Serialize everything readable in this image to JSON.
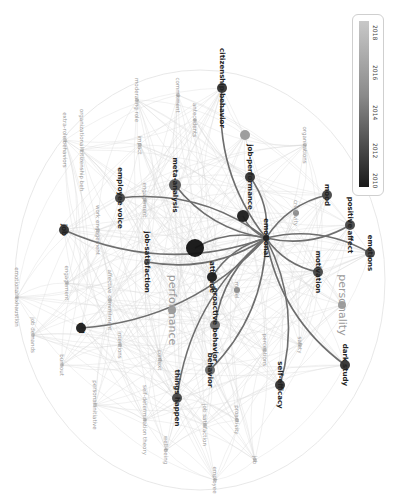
{
  "visualization": {
    "type": "overlay-network",
    "orientation": "rotated 90deg clockwise",
    "legend": {
      "ticks": [
        "2018",
        "2016",
        "2014",
        "2012",
        "2010"
      ],
      "gradient_start": "#c8c8c8",
      "gradient_end": "#1a1a1a"
    },
    "nodes": [
      {
        "id": "citizenship-behavior",
        "label": "citizenship behavior",
        "x": 222,
        "y": 88,
        "r": 5,
        "color": "#333333",
        "bold": true
      },
      {
        "id": "commitment",
        "label": "commitment",
        "x": 178,
        "y": 95,
        "r": 2,
        "color": "#aaaaaa",
        "bold": false
      },
      {
        "id": "moderating-role",
        "label": "moderating role",
        "x": 137,
        "y": 100,
        "r": 2,
        "color": "#aaaaaa",
        "bold": false
      },
      {
        "id": "antecedents",
        "label": "antecedents",
        "x": 195,
        "y": 120,
        "r": 2,
        "color": "#aaaaaa",
        "bold": false
      },
      {
        "id": "extra-role-behaviors",
        "label": "extra-role behaviors",
        "x": 65,
        "y": 140,
        "r": 2,
        "color": "#aaaaaa",
        "bold": false
      },
      {
        "id": "organizational-citizenship-beh",
        "label": "organizational citizenship beh",
        "x": 82,
        "y": 150,
        "r": 2,
        "color": "#aaaaaa",
        "bold": false
      },
      {
        "id": "organizations",
        "label": "organizations",
        "x": 305,
        "y": 145,
        "r": 2,
        "color": "#aaaaaa",
        "bold": false
      },
      {
        "id": "impact",
        "label": "impact",
        "x": 140,
        "y": 145,
        "r": 2,
        "color": "#aaaaaa",
        "bold": false
      },
      {
        "id": "node-grey-top",
        "label": "",
        "x": 245,
        "y": 135,
        "r": 5,
        "color": "#999999",
        "bold": false
      },
      {
        "id": "meta-analysis",
        "label": "meta-analysis",
        "x": 175,
        "y": 185,
        "r": 6,
        "color": "#555555",
        "bold": true
      },
      {
        "id": "job-performance",
        "label": "job-performance",
        "x": 250,
        "y": 177,
        "r": 5,
        "color": "#333333",
        "bold": true
      },
      {
        "id": "employee-voice",
        "label": "employee voice",
        "x": 120,
        "y": 198,
        "r": 5,
        "color": "#444444",
        "bold": true
      },
      {
        "id": "engagement-top",
        "label": "engagement",
        "x": 145,
        "y": 200,
        "r": 2,
        "color": "#aaaaaa",
        "bold": false
      },
      {
        "id": "mood",
        "label": "mood",
        "x": 327,
        "y": 195,
        "r": 5,
        "color": "#444444",
        "bold": true
      },
      {
        "id": "creativity",
        "label": "creativity",
        "x": 296,
        "y": 213,
        "r": 3,
        "color": "#888888",
        "bold": false
      },
      {
        "id": "node-dark-1",
        "label": "",
        "x": 243,
        "y": 216,
        "r": 6,
        "color": "#1a1a1a",
        "bold": false
      },
      {
        "id": "job",
        "label": "job",
        "x": 64,
        "y": 230,
        "r": 5,
        "color": "#333333",
        "bold": true
      },
      {
        "id": "work-engagement",
        "label": "work engagement",
        "x": 98,
        "y": 230,
        "r": 2,
        "color": "#aaaaaa",
        "bold": false
      },
      {
        "id": "positive-affect",
        "label": "positive affect",
        "x": 350,
        "y": 225,
        "r": 5,
        "color": "#444444",
        "bold": true
      },
      {
        "id": "job-satisfaction",
        "label": "job-satisfaction",
        "x": 147,
        "y": 262,
        "r": 3,
        "color": "#666666",
        "bold": true
      },
      {
        "id": "big-dark",
        "label": "",
        "x": 195,
        "y": 248,
        "r": 9,
        "color": "#111111",
        "bold": false
      },
      {
        "id": "center-hub",
        "label": "emotional",
        "x": 266,
        "y": 238,
        "r": 3,
        "color": "#222222",
        "bold": true
      },
      {
        "id": "engagement-left",
        "label": "engagement",
        "x": 67,
        "y": 283,
        "r": 2,
        "color": "#aaaaaa",
        "bold": false
      },
      {
        "id": "emotions",
        "label": "emotions",
        "x": 370,
        "y": 253,
        "r": 5,
        "color": "#444444",
        "bold": true
      },
      {
        "id": "attitude",
        "label": "attitude",
        "x": 212,
        "y": 277,
        "r": 5,
        "color": "#1a1a1a",
        "bold": true
      },
      {
        "id": "motivation",
        "label": "motivation",
        "x": 318,
        "y": 272,
        "r": 5,
        "color": "#444444",
        "bold": true
      },
      {
        "id": "affective-commitment",
        "label": "affective commitment",
        "x": 110,
        "y": 300,
        "r": 2,
        "color": "#aaaaaa",
        "bold": false
      },
      {
        "id": "emotional-exhaustion",
        "label": "emotional exhaustion",
        "x": 17,
        "y": 297,
        "r": 2,
        "color": "#aaaaaa",
        "bold": false
      },
      {
        "id": "model",
        "label": "model",
        "x": 237,
        "y": 290,
        "r": 3,
        "color": "#888888",
        "bold": false
      },
      {
        "id": "performance",
        "label": "performance",
        "x": 172,
        "y": 310,
        "r": 4,
        "color": "#999999",
        "bold": false
      },
      {
        "id": "personality",
        "label": "personality",
        "x": 342,
        "y": 305,
        "r": 4,
        "color": "#999999",
        "bold": false
      },
      {
        "id": "proactive-behavior",
        "label": "proactive behavior",
        "x": 215,
        "y": 325,
        "r": 5,
        "color": "#666666",
        "bold": true
      },
      {
        "id": "job-demands",
        "label": "job demands",
        "x": 33,
        "y": 335,
        "r": 2,
        "color": "#aaaaaa",
        "bold": false
      },
      {
        "id": "ucl",
        "label": "ucl",
        "x": 81,
        "y": 328,
        "r": 5,
        "color": "#1a1a1a",
        "bold": true
      },
      {
        "id": "intentions",
        "label": "intentions",
        "x": 120,
        "y": 345,
        "r": 2,
        "color": "#aaaaaa",
        "bold": false
      },
      {
        "id": "context",
        "label": "context",
        "x": 160,
        "y": 360,
        "r": 2,
        "color": "#aaaaaa",
        "bold": false
      },
      {
        "id": "safety",
        "label": "safety",
        "x": 300,
        "y": 345,
        "r": 2,
        "color": "#aaaaaa",
        "bold": false
      },
      {
        "id": "perceptions",
        "label": "perceptions",
        "x": 265,
        "y": 350,
        "r": 2,
        "color": "#aaaaaa",
        "bold": false
      },
      {
        "id": "dark-study",
        "label": "dark study",
        "x": 345,
        "y": 365,
        "r": 5,
        "color": "#333333",
        "bold": true
      },
      {
        "id": "burnout",
        "label": "burnout",
        "x": 62,
        "y": 365,
        "r": 2,
        "color": "#aaaaaa",
        "bold": false
      },
      {
        "id": "behavior",
        "label": "behavior",
        "x": 210,
        "y": 370,
        "r": 5,
        "color": "#666666",
        "bold": true
      },
      {
        "id": "personal-initiative",
        "label": "personal initiative",
        "x": 95,
        "y": 405,
        "r": 2,
        "color": "#aaaaaa",
        "bold": false
      },
      {
        "id": "self-determination-theory",
        "label": "self-determination theory",
        "x": 145,
        "y": 420,
        "r": 2,
        "color": "#aaaaaa",
        "bold": false
      },
      {
        "id": "things-happen",
        "label": "things happen",
        "x": 177,
        "y": 398,
        "r": 5,
        "color": "#444444",
        "bold": true
      },
      {
        "id": "self-efficacy",
        "label": "self-efficacy",
        "x": 280,
        "y": 385,
        "r": 5,
        "color": "#333333",
        "bold": true
      },
      {
        "id": "proactivity",
        "label": "proactivity",
        "x": 237,
        "y": 420,
        "r": 2,
        "color": "#999999",
        "bold": false
      },
      {
        "id": "job-satisfaction-2",
        "label": "job satisfaction",
        "x": 205,
        "y": 425,
        "r": 2,
        "color": "#aaaaaa",
        "bold": false
      },
      {
        "id": "well-being",
        "label": "well-being",
        "x": 166,
        "y": 450,
        "r": 2,
        "color": "#aaaaaa",
        "bold": false
      },
      {
        "id": "employee",
        "label": "employee",
        "x": 215,
        "y": 480,
        "r": 2,
        "color": "#aaaaaa",
        "bold": false
      },
      {
        "id": "job-bottom",
        "label": "job",
        "x": 255,
        "y": 460,
        "r": 2,
        "color": "#aaaaaa",
        "bold": false
      }
    ],
    "highlighted_edges_from": "center-hub",
    "highlighted_edges_to": [
      "citizenship-behavior",
      "job-performance",
      "meta-analysis",
      "employee-voice",
      "mood",
      "positive-affect",
      "emotions",
      "motivation",
      "job",
      "big-dark",
      "node-dark-1",
      "attitude",
      "ucl",
      "proactive-behavior",
      "behavior",
      "things-happen",
      "self-efficacy",
      "dark-study",
      "job-satisfaction"
    ]
  }
}
